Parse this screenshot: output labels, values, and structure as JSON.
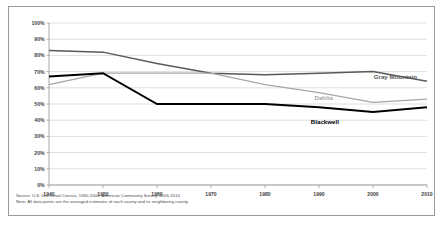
{
  "chart_data": {
    "type": "line",
    "title": "",
    "xlabel": "",
    "ylabel": "",
    "x": [
      1940,
      1950,
      1960,
      1970,
      1980,
      1990,
      2000,
      2010
    ],
    "categories": [
      "1940",
      "1950",
      "1960",
      "1970",
      "1980",
      "1990",
      "2000",
      "2010"
    ],
    "xtick_labels": [
      "1940",
      "1950",
      "1960",
      "1970",
      "1980",
      "1990",
      "2000",
      "2010"
    ],
    "ytick_labels": [
      "0%",
      "10%",
      "20%",
      "30%",
      "40%",
      "50%",
      "60%",
      "70%",
      "80%",
      "90%",
      "100%"
    ],
    "ytick_values": [
      0,
      10,
      20,
      30,
      40,
      50,
      60,
      70,
      80,
      90,
      100
    ],
    "ylim": [
      0,
      100
    ],
    "xlim": [
      1940,
      2010
    ],
    "grid": "horizontal",
    "legend_position": "inline-labels",
    "series": [
      {
        "name": "Gray Mountain",
        "color": "#595959",
        "values": [
          83,
          82,
          75,
          69,
          68,
          69,
          70,
          64
        ],
        "label_text": "Gray Mountain"
      },
      {
        "name": "Dahlia",
        "color": "#a6a6a6",
        "values": [
          62,
          69,
          69,
          69,
          62,
          57,
          51,
          53
        ],
        "label_text": "Dahlia"
      },
      {
        "name": "Blackwell",
        "color": "#000000",
        "values": [
          67,
          69,
          50,
          50,
          50,
          48,
          45,
          48
        ],
        "label_text": "Blackwell"
      }
    ]
  },
  "footnotes": {
    "source": "Source: U.S. Decennial Census, 1940-2000; American Community Survey, 2006-2010",
    "note": "Note: All data points are the averaged estimates of each county and its neighboring county."
  }
}
